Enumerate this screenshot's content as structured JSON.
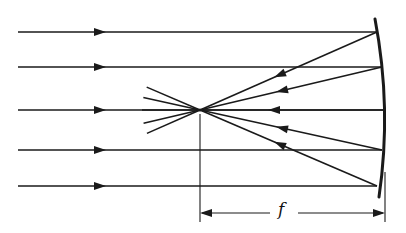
{
  "diagram": {
    "colors": {
      "stroke": "#1a1a1a",
      "background": "#ffffff"
    },
    "incident_rays": [
      {
        "y": 32,
        "x_start": 18,
        "x_end": 377,
        "arrow_x": 100
      },
      {
        "y": 67,
        "x_start": 18,
        "x_end": 382,
        "arrow_x": 100
      },
      {
        "y": 110,
        "x_start": 18,
        "x_end": 385,
        "arrow_x": 100
      },
      {
        "y": 150,
        "x_start": 18,
        "x_end": 382,
        "arrow_x": 100
      },
      {
        "y": 186,
        "x_start": 18,
        "x_end": 377,
        "arrow_x": 100
      }
    ],
    "focal_point": {
      "x": 200,
      "y": 110
    },
    "reflected_rays": [
      {
        "from": [
          377,
          32
        ],
        "arrow_at": 0.55
      },
      {
        "from": [
          382,
          67
        ],
        "arrow_at": 0.55
      },
      {
        "from": [
          385,
          110
        ],
        "arrow_at": 0.6
      },
      {
        "from": [
          382,
          150
        ],
        "arrow_at": 0.55
      },
      {
        "from": [
          377,
          186
        ],
        "arrow_at": 0.55
      }
    ],
    "mirror": {
      "top": [
        375,
        19
      ],
      "bottom": [
        379,
        197
      ],
      "bulge_x": 392
    },
    "dimension": {
      "label": "f",
      "y": 213,
      "x_left": 200,
      "x_right": 385
    }
  }
}
